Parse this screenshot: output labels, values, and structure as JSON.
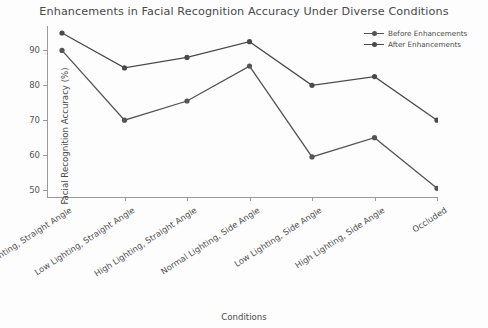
{
  "chart_data": {
    "type": "line",
    "title": "Enhancements in Facial Recognition Accuracy Under Diverse Conditions",
    "xlabel": "Conditions",
    "ylabel": "Facial Recognition Accuracy (%)",
    "categories": [
      "Normal Lighting, Straight Angle",
      "Low Lighting, Straight Angle",
      "High Lighting, Straight Angle",
      "Normal Lighting, Side Angle",
      "Low Lighting, Side Angle",
      "High Lighting, Side Angle",
      "Occluded"
    ],
    "series": [
      {
        "name": "Before Enhancements",
        "color": "#555555",
        "values": [
          90,
          70,
          75.5,
          85.5,
          59.5,
          65,
          50.5
        ]
      },
      {
        "name": "After Enhancements",
        "color": "#4a4a4a",
        "values": [
          95,
          85,
          88,
          92.5,
          80,
          82.5,
          70
        ]
      }
    ],
    "ylim": [
      48,
      97
    ],
    "yticks": [
      50,
      60,
      70,
      80,
      90
    ],
    "ytick_labels": [
      "50",
      "60",
      "70",
      "80",
      "90"
    ],
    "grid": false,
    "legend_position": "top-right"
  },
  "legend": {
    "items": [
      {
        "label": "Before Enhancements",
        "color": "#555555"
      },
      {
        "label": "After Enhancements",
        "color": "#4a4a4a"
      }
    ]
  }
}
